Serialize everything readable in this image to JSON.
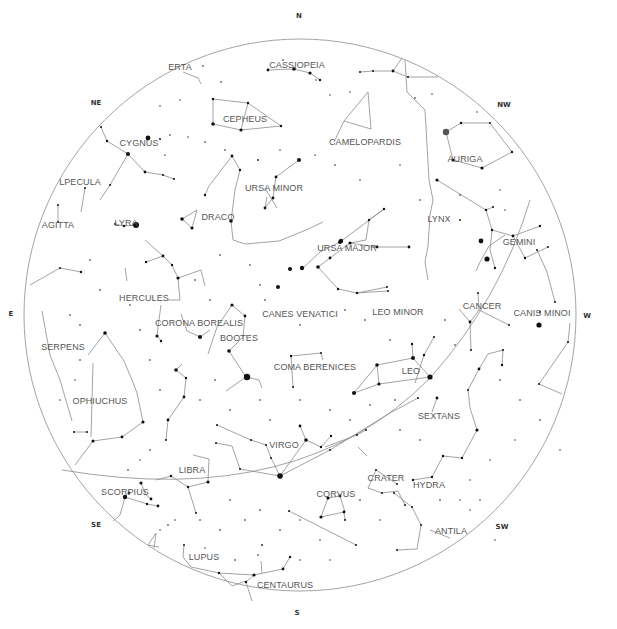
{
  "sky": {
    "center": [
      300,
      315
    ],
    "radius": 276,
    "horizon_color": "#9a9a9a",
    "line_color": "#8c8c8c",
    "star_color": "#111111",
    "label_color": "#555555",
    "ecliptic": "M 62 470 Q 300 510 430 378 Q 500 300 530 200"
  },
  "compass": [
    {
      "label": "N",
      "x": 299,
      "y": 16
    },
    {
      "label": "NE",
      "x": 96,
      "y": 103
    },
    {
      "label": "E",
      "x": 11,
      "y": 314
    },
    {
      "label": "SE",
      "x": 96,
      "y": 525
    },
    {
      "label": "S",
      "x": 297,
      "y": 613
    },
    {
      "label": "SW",
      "x": 502,
      "y": 527
    },
    {
      "label": "W",
      "x": 587,
      "y": 316
    },
    {
      "label": "NW",
      "x": 504,
      "y": 105
    }
  ],
  "constellations": [
    {
      "name": "CASSIOPEIA",
      "x": 297,
      "y": 65
    },
    {
      "name": "LACERTA",
      "x": 180,
      "y": 67,
      "display": "ERTA"
    },
    {
      "name": "CEPHEUS",
      "x": 245,
      "y": 119
    },
    {
      "name": "CAMELOPARDIS",
      "x": 365,
      "y": 142
    },
    {
      "name": "AURIGA",
      "x": 465,
      "y": 159
    },
    {
      "name": "CYGNUS",
      "x": 139,
      "y": 143
    },
    {
      "name": "VULPECULA",
      "x": 80,
      "y": 182,
      "display": "LPECULA"
    },
    {
      "name": "URSA MINOR",
      "x": 274,
      "y": 188
    },
    {
      "name": "SAGITTA",
      "x": 58,
      "y": 225,
      "display": "AGITTA"
    },
    {
      "name": "LYRA",
      "x": 126,
      "y": 223
    },
    {
      "name": "DRACO",
      "x": 218,
      "y": 217
    },
    {
      "name": "LYNX",
      "x": 439,
      "y": 219
    },
    {
      "name": "GEMINI",
      "x": 519,
      "y": 242
    },
    {
      "name": "URSA MAJOR",
      "x": 347,
      "y": 248
    },
    {
      "name": "HERCULES",
      "x": 144,
      "y": 298
    },
    {
      "name": "CANCER",
      "x": 482,
      "y": 306
    },
    {
      "name": "CANES VENATICI",
      "x": 300,
      "y": 314
    },
    {
      "name": "LEO MINOR",
      "x": 398,
      "y": 312
    },
    {
      "name": "CANIS MINOR",
      "x": 542,
      "y": 313,
      "display": "CANIS MINOI"
    },
    {
      "name": "CORONA BOREALIS",
      "x": 199,
      "y": 323
    },
    {
      "name": "BOOTES",
      "x": 239,
      "y": 338
    },
    {
      "name": "SERPENS",
      "x": 63,
      "y": 347
    },
    {
      "name": "COMA BERENICES",
      "x": 315,
      "y": 367
    },
    {
      "name": "LEO",
      "x": 411,
      "y": 371
    },
    {
      "name": "OPHIUCHUS",
      "x": 100,
      "y": 401
    },
    {
      "name": "SEXTANS",
      "x": 439,
      "y": 416
    },
    {
      "name": "VIRGO",
      "x": 284,
      "y": 445
    },
    {
      "name": "LIBRA",
      "x": 192,
      "y": 470
    },
    {
      "name": "CRATER",
      "x": 386,
      "y": 478
    },
    {
      "name": "HYDRA",
      "x": 429,
      "y": 485
    },
    {
      "name": "CORVUS",
      "x": 336,
      "y": 494
    },
    {
      "name": "SCORPIUS",
      "x": 125,
      "y": 492
    },
    {
      "name": "ANTILA",
      "x": 451,
      "y": 531
    },
    {
      "name": "LUPUS",
      "x": 204,
      "y": 557
    },
    {
      "name": "CENTAURUS",
      "x": 285,
      "y": 585
    }
  ],
  "lines": [
    "M 268 70 L 294 69 L 310 73 L 320 80",
    "M 360 72 L 373 71 L 393 71 L 408 77 L 438 77",
    "M 393 71 L 402 58",
    "M 183 72 L 198 78 L 201 84",
    "M 213 99 L 248 103 L 281 126 L 241 130 L 213 124 Z",
    "M 248 103 L 241 130",
    "M 344 121 L 368 92 L 371 129 Z",
    "M 334 142 L 344 121",
    "M 446 132 L 461 123 L 490 123 L 512 152 L 482 168 L 453 160 Z",
    "M 101 127 L 107 141 L 128 154 L 145 172 L 163 175 L 174 179",
    "M 128 154 L 110 185 L 100 200",
    "M 85 188 L 81 212",
    "M 58 205 L 58 222",
    "M 115 224 L 124 226 L 136 225",
    "M 232 156 L 240 170 L 235 190 L 231 221 L 233 240 L 245 244 L 279 241 L 306 230 L 323 222",
    "M 232 156 L 209 186 L 205 195",
    "M 182 219 L 197 210 L 192 228 L 182 219",
    "M 299 160 L 276 177 L 273 198 L 265 208 L 267 197",
    "M 265 188 L 277 208",
    "M 384 209 L 369 220 L 366 240 L 350 243 L 330 258 L 318 267",
    "M 350 243 L 377 247 L 409 247",
    "M 384 209 L 340 242 L 320 252 L 303 268",
    "M 318 267 L 338 289 L 357 293 L 387 287",
    "M 357 293 L 387 291",
    "M 405 60 L 407 92 L 425 110 L 429 180 L 433 200 L 430 215 L 428 246 L 425 262 L 428 280",
    "M 437 180 L 486 210 L 493 207",
    "M 505 235 L 489 246 L 480 262 L 476 271",
    "M 486 210 L 492 230 L 490 250 L 495 268",
    "M 492 230 L 513 236 L 540 226",
    "M 513 236 L 525 258 L 548 247",
    "M 478 293 L 479 310 L 470 322 L 459 309",
    "M 479 310 L 509 325",
    "M 470 322 L 471 350",
    "M 145 240 L 163 256 L 172 265 L 178 278 L 180 300 L 167 300",
    "M 178 278 L 201 270 L 205 286",
    "M 163 256 L 146 262",
    "M 125 268 L 127 281",
    "M 81 272 L 60 268 L 30 285",
    "M 181 314 L 187 331 L 200 337 L 210 330",
    "M 232 305 L 245 316 L 243 337 L 229 351 L 246 377 L 259 380 L 262 388",
    "M 246 377 L 226 391",
    "M 232 305 L 217 327 L 208 354",
    "M 161 305 L 158 327 L 157 336 L 161 341",
    "M 168 420 L 184 397 L 186 378 L 176 370 L 182 364",
    "M 168 420 L 166 440",
    "M 91 437 L 93 363",
    "M 74 432 L 87 432",
    "M 105 333 L 124 361 L 132 380 L 137 393 L 143 422 L 122 437 L 93 441 L 75 465",
    "M 105 333 L 88 355",
    "M 42 311 L 50 355 L 60 380 L 72 421",
    "M 291 356 L 321 353 L 323 360",
    "M 291 356 L 293 387",
    "M 354 393 L 377 365 L 413 358 L 430 377 L 379 384 L 354 393",
    "M 377 365 L 379 384",
    "M 413 358 L 412 344",
    "M 325 447 L 357 435 L 366 430",
    "M 367 456 L 358 447",
    "M 300 426 L 306 440 L 321 447 L 331 436",
    "M 280 476 L 271 458 L 266 445 L 251 440 L 217 425",
    "M 280 476 L 306 440",
    "M 216 443 L 232 446 L 240 469 L 280 476",
    "M 280 476 L 330 450 L 390 413 L 418 398",
    "M 415 383 L 424 355 L 434 337",
    "M 437 398 L 432 412",
    "M 477 430 L 470 408 L 468 390 L 479 369 L 488 354 L 503 350 L 502 365",
    "M 477 430 L 462 458 L 443 456 L 432 477 L 413 480",
    "M 397 484 L 376 470 L 368 488 L 382 493 L 398 491 L 405 505",
    "M 394 493 L 412 507 L 421 525 L 417 549 L 397 550",
    "M 328 498 L 321 517 L 344 512 L 345 520",
    "M 328 498 L 340 496 L 345 512",
    "M 289 511 L 356 545",
    "M 555 302 L 547 272 L 537 250",
    "M 570 323 L 568 342 L 539 384 L 562 394",
    "M 156 480 L 171 476 L 188 487 L 196 513",
    "M 188 487 L 208 482 L 209 459 L 193 455",
    "M 141 483 L 146 495 L 151 499",
    "M 125 497 L 147 504 L 158 506",
    "M 125 497 L 120 515 L 113 521",
    "M 156 533 L 148 545 L 159 547",
    "M 156 533 L 154 548",
    "M 184 545 L 183 557 L 191 567 L 219 573 L 254 575 L 283 569 L 290 557",
    "M 254 575 L 246 582 L 252 601",
    "M 219 573 L 232 586 L 246 581",
    "M 261 561 L 262 573",
    "M 430 530 L 450 538"
  ],
  "stars": [
    [
      446,
      132,
      3.2,
      "#555"
    ],
    [
      247,
      377,
      3.2
    ],
    [
      136,
      225,
      3
    ],
    [
      280,
      476,
      2.8
    ],
    [
      430,
      377,
      2.6
    ],
    [
      539,
      325,
      2.6
    ],
    [
      487,
      259,
      2.6
    ],
    [
      481,
      241,
      2.4
    ],
    [
      148,
      138,
      2.4
    ],
    [
      128,
      154,
      2
    ],
    [
      299,
      160,
      2
    ],
    [
      341,
      241,
      2.2
    ],
    [
      340,
      242,
      2
    ],
    [
      302,
      268,
      2.2
    ],
    [
      290,
      269,
      2
    ],
    [
      278,
      287,
      2
    ],
    [
      354,
      393,
      2
    ],
    [
      413,
      358,
      2
    ],
    [
      377,
      365,
      1.8
    ],
    [
      379,
      384,
      1.6
    ],
    [
      105,
      333,
      1.8
    ],
    [
      93,
      441,
      1.5
    ],
    [
      122,
      437,
      1.4
    ],
    [
      143,
      422,
      1.6
    ],
    [
      200,
      337,
      2
    ],
    [
      232,
      305,
      1.6
    ],
    [
      229,
      351,
      1.8
    ],
    [
      245,
      316,
      1.4
    ],
    [
      178,
      278,
      1.6
    ],
    [
      163,
      256,
      1.4
    ],
    [
      146,
      262,
      1.2
    ],
    [
      172,
      265,
      1.2
    ],
    [
      157,
      336,
      1.6
    ],
    [
      161,
      341,
      1.2
    ],
    [
      176,
      370,
      1.8
    ],
    [
      168,
      420,
      1.4
    ],
    [
      182,
      219,
      1.8
    ],
    [
      192,
      228,
      1.6
    ],
    [
      205,
      195,
      1.2
    ],
    [
      231,
      221,
      1.8
    ],
    [
      232,
      156,
      1.4
    ],
    [
      240,
      170,
      1.2
    ],
    [
      265,
      208,
      1.4
    ],
    [
      276,
      177,
      1.4
    ],
    [
      273,
      198,
      1.4
    ],
    [
      213,
      124,
      1.8
    ],
    [
      241,
      130,
      1.6
    ],
    [
      248,
      103,
      1.2
    ],
    [
      213,
      99,
      1.2
    ],
    [
      281,
      126,
      1.2
    ],
    [
      268,
      70,
      1.4
    ],
    [
      294,
      69,
      1.8
    ],
    [
      310,
      73,
      1.6
    ],
    [
      320,
      80,
      1.2
    ],
    [
      360,
      72,
      1
    ],
    [
      373,
      71,
      1
    ],
    [
      393,
      71,
      1.4
    ],
    [
      408,
      77,
      1
    ],
    [
      461,
      123,
      1.2
    ],
    [
      490,
      123,
      1
    ],
    [
      512,
      152,
      1.2
    ],
    [
      482,
      168,
      1.6
    ],
    [
      453,
      160,
      1.6
    ],
    [
      318,
      267,
      1.8
    ],
    [
      330,
      258,
      1.4
    ],
    [
      350,
      243,
      1.6
    ],
    [
      384,
      209,
      1.2
    ],
    [
      369,
      220,
      1.2
    ],
    [
      377,
      247,
      1.4
    ],
    [
      409,
      247,
      1.4
    ],
    [
      338,
      289,
      1.2
    ],
    [
      357,
      293,
      1.2
    ],
    [
      387,
      287,
      1
    ],
    [
      437,
      180,
      1.6
    ],
    [
      486,
      210,
      1.2
    ],
    [
      493,
      207,
      1
    ],
    [
      513,
      236,
      1.4
    ],
    [
      540,
      226,
      1.2
    ],
    [
      525,
      258,
      1.2
    ],
    [
      548,
      247,
      1
    ],
    [
      492,
      230,
      1.2
    ],
    [
      495,
      268,
      1.2
    ],
    [
      478,
      293,
      1
    ],
    [
      470,
      322,
      1.4
    ],
    [
      509,
      325,
      1
    ],
    [
      471,
      350,
      1
    ],
    [
      330,
      450,
      1
    ],
    [
      306,
      440,
      1.8
    ],
    [
      300,
      426,
      1.4
    ],
    [
      321,
      447,
      1.2
    ],
    [
      331,
      436,
      1.2
    ],
    [
      328,
      498,
      1.6
    ],
    [
      340,
      496,
      1.4
    ],
    [
      321,
      517,
      1.6
    ],
    [
      344,
      512,
      1.4
    ],
    [
      345,
      520,
      1
    ],
    [
      437,
      398,
      1.4
    ],
    [
      477,
      430,
      1.6
    ],
    [
      462,
      458,
      1.2
    ],
    [
      443,
      456,
      1.2
    ],
    [
      432,
      477,
      1.2
    ],
    [
      413,
      480,
      1.2
    ],
    [
      388,
      291,
      1
    ],
    [
      424,
      355,
      1.2
    ],
    [
      434,
      337,
      1
    ],
    [
      418,
      398,
      1
    ],
    [
      141,
      483,
      1.6
    ],
    [
      125,
      497,
      2.2
    ],
    [
      151,
      499,
      1.4
    ],
    [
      147,
      504,
      1.2
    ],
    [
      158,
      506,
      1.4
    ],
    [
      129,
      493,
      1.4
    ],
    [
      208,
      482,
      1.6
    ],
    [
      188,
      487,
      1.2
    ],
    [
      171,
      476,
      1.2
    ],
    [
      196,
      513,
      1
    ],
    [
      166,
      440,
      1
    ],
    [
      184,
      397,
      1.4
    ],
    [
      186,
      378,
      1.2
    ],
    [
      81,
      272,
      1.2
    ],
    [
      60,
      268,
      1
    ],
    [
      74,
      432,
      1
    ],
    [
      87,
      432,
      1
    ],
    [
      58,
      205,
      1
    ],
    [
      85,
      188,
      1
    ],
    [
      115,
      224,
      1
    ],
    [
      124,
      226,
      1.2
    ],
    [
      58,
      222,
      1
    ],
    [
      145,
      172,
      1.4
    ],
    [
      163,
      175,
      1
    ],
    [
      174,
      179,
      1
    ],
    [
      107,
      141,
      1.2
    ],
    [
      160,
      139,
      1
    ],
    [
      110,
      185,
      1
    ],
    [
      101,
      127,
      1
    ],
    [
      217,
      425,
      1
    ],
    [
      251,
      440,
      1
    ],
    [
      216,
      443,
      1
    ],
    [
      240,
      469,
      1
    ],
    [
      266,
      445,
      1
    ],
    [
      271,
      458,
      1
    ],
    [
      291,
      356,
      1.2
    ],
    [
      321,
      353,
      1
    ],
    [
      293,
      387,
      1
    ],
    [
      366,
      430,
      1
    ],
    [
      357,
      435,
      1
    ],
    [
      289,
      511,
      1
    ],
    [
      356,
      545,
      1
    ],
    [
      502,
      365,
      1.2
    ],
    [
      479,
      369,
      1.4
    ],
    [
      503,
      350,
      1
    ],
    [
      468,
      390,
      1
    ],
    [
      412,
      344,
      1.2
    ],
    [
      254,
      575,
      1.6
    ],
    [
      283,
      569,
      1.4
    ],
    [
      290,
      557,
      1.2
    ],
    [
      246,
      582,
      1.2
    ],
    [
      219,
      573,
      1.2
    ],
    [
      184,
      545,
      1
    ],
    [
      397,
      550,
      1
    ],
    [
      421,
      525,
      1
    ],
    [
      412,
      507,
      1
    ],
    [
      394,
      493,
      1
    ],
    [
      382,
      493,
      1
    ],
    [
      376,
      470,
      1
    ],
    [
      397,
      484,
      1
    ],
    [
      405,
      505,
      1
    ],
    [
      555,
      302,
      1
    ],
    [
      537,
      250,
      1
    ],
    [
      540,
      312,
      1
    ],
    [
      568,
      342,
      1
    ],
    [
      539,
      384,
      1
    ],
    [
      203,
      66,
      0.8
    ],
    [
      221,
      82,
      0.8
    ],
    [
      283,
      60,
      0.8
    ],
    [
      316,
      80,
      0.7
    ],
    [
      330,
      95,
      0.7
    ],
    [
      350,
      92,
      0.7
    ],
    [
      415,
      98,
      0.8
    ],
    [
      432,
      94,
      0.7
    ],
    [
      477,
      112,
      0.7
    ],
    [
      160,
      106,
      0.7
    ],
    [
      180,
      100,
      0.7
    ],
    [
      188,
      137,
      0.7
    ],
    [
      170,
      135,
      0.8
    ],
    [
      165,
      155,
      0.7
    ],
    [
      205,
      142,
      0.8
    ],
    [
      225,
      150,
      0.8
    ],
    [
      258,
      160,
      0.9
    ],
    [
      280,
      150,
      0.7
    ],
    [
      315,
      155,
      0.7
    ],
    [
      335,
      165,
      0.8
    ],
    [
      360,
      180,
      0.7
    ],
    [
      400,
      165,
      0.7
    ],
    [
      420,
      200,
      0.8
    ],
    [
      460,
      195,
      0.8
    ],
    [
      460,
      220,
      0.9
    ],
    [
      500,
      190,
      0.7
    ],
    [
      505,
      210,
      0.7
    ],
    [
      90,
      260,
      0.8
    ],
    [
      100,
      290,
      0.8
    ],
    [
      70,
      315,
      0.8
    ],
    [
      80,
      325,
      0.8
    ],
    [
      130,
      305,
      0.8
    ],
    [
      140,
      330,
      0.8
    ],
    [
      210,
      300,
      0.8
    ],
    [
      195,
      280,
      0.8
    ],
    [
      220,
      255,
      0.8
    ],
    [
      250,
      265,
      0.8
    ],
    [
      260,
      285,
      0.8
    ],
    [
      265,
      300,
      0.8
    ],
    [
      300,
      325,
      0.8
    ],
    [
      345,
      310,
      0.8
    ],
    [
      365,
      320,
      0.8
    ],
    [
      390,
      340,
      0.8
    ],
    [
      445,
      320,
      0.8
    ],
    [
      455,
      345,
      0.8
    ],
    [
      500,
      380,
      0.8
    ],
    [
      520,
      400,
      0.8
    ],
    [
      540,
      420,
      0.8
    ],
    [
      560,
      450,
      0.7
    ],
    [
      515,
      440,
      0.7
    ],
    [
      490,
      460,
      0.7
    ],
    [
      470,
      480,
      0.7
    ],
    [
      460,
      500,
      0.7
    ],
    [
      480,
      500,
      0.7
    ],
    [
      80,
      360,
      0.8
    ],
    [
      60,
      400,
      0.7
    ],
    [
      75,
      380,
      0.7
    ],
    [
      150,
      360,
      0.8
    ],
    [
      160,
      390,
      0.8
    ],
    [
      200,
      400,
      0.8
    ],
    [
      215,
      380,
      0.8
    ],
    [
      230,
      410,
      0.8
    ],
    [
      260,
      400,
      0.8
    ],
    [
      270,
      420,
      0.8
    ],
    [
      300,
      400,
      0.8
    ],
    [
      330,
      410,
      0.8
    ],
    [
      350,
      420,
      0.8
    ],
    [
      370,
      405,
      0.8
    ],
    [
      395,
      400,
      0.8
    ],
    [
      400,
      430,
      0.8
    ],
    [
      420,
      440,
      0.8
    ],
    [
      150,
      450,
      0.8
    ],
    [
      140,
      460,
      0.7
    ],
    [
      128,
      470,
      0.8
    ],
    [
      230,
      500,
      0.8
    ],
    [
      245,
      520,
      0.8
    ],
    [
      260,
      510,
      0.8
    ],
    [
      280,
      530,
      0.8
    ],
    [
      300,
      520,
      0.7
    ],
    [
      320,
      540,
      0.7
    ],
    [
      330,
      560,
      0.7
    ],
    [
      200,
      520,
      0.8
    ],
    [
      220,
      530,
      0.8
    ],
    [
      175,
      520,
      0.7
    ],
    [
      160,
      530,
      0.7
    ],
    [
      235,
      560,
      0.8
    ],
    [
      262,
      545,
      0.9
    ],
    [
      258,
      555,
      0.8
    ],
    [
      205,
      548,
      0.7
    ],
    [
      168,
      525,
      0.8
    ],
    [
      300,
      560,
      0.7
    ],
    [
      360,
      500,
      0.8
    ],
    [
      380,
      520,
      0.7
    ],
    [
      440,
      500,
      0.8
    ],
    [
      470,
      510,
      0.7
    ],
    [
      495,
      540,
      0.7
    ]
  ]
}
